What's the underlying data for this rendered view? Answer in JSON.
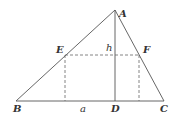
{
  "diagram": {
    "title": "",
    "points": {
      "A": {
        "label": "A",
        "x": 115,
        "y": 10
      },
      "B": {
        "label": "B",
        "x": 16,
        "y": 101
      },
      "C": {
        "label": "C",
        "x": 164,
        "y": 101
      },
      "D": {
        "label": "D",
        "x": 115,
        "y": 101
      },
      "E": {
        "label": "E",
        "x": 65,
        "y": 55
      },
      "F": {
        "label": "F",
        "x": 139,
        "y": 55
      }
    },
    "segment_labels": {
      "h": "h",
      "a": "a"
    },
    "colors": {
      "line": "#555555",
      "text": "#333333"
    }
  }
}
